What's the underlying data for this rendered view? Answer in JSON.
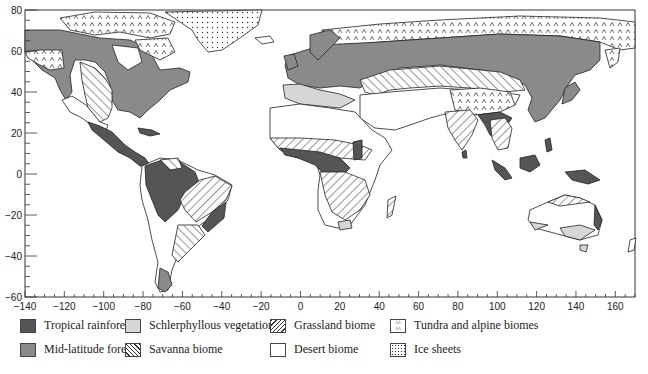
{
  "map": {
    "type": "world-biome-map",
    "projection": "equirectangular",
    "x_axis": {
      "range": [
        -140,
        170
      ],
      "ticks": [
        -140,
        -120,
        -100,
        -80,
        -60,
        -40,
        -20,
        0,
        20,
        40,
        60,
        80,
        100,
        120,
        140,
        160
      ],
      "tick_labels": [
        "−140",
        "−120",
        "−100",
        "−80",
        "−60",
        "−40",
        "−20",
        "0",
        "20",
        "40",
        "60",
        "80",
        "100",
        "120",
        "140",
        "160"
      ]
    },
    "y_axis": {
      "range": [
        -60,
        80
      ],
      "ticks": [
        80,
        60,
        40,
        20,
        0,
        -20,
        -40,
        -60
      ],
      "tick_labels": [
        "80",
        "60",
        "40",
        "20",
        "0",
        "−20",
        "−40",
        "−60"
      ]
    },
    "colors": {
      "tropical_rainforest": "#555555",
      "mid_latitude_forest": "#8a8a8a",
      "schlerphyllous": "#d6d6d6",
      "desert": "#ffffff",
      "outline": "#222222"
    }
  },
  "legend": {
    "items": [
      {
        "key": "tropical",
        "label": "Tropical rainforest",
        "icon": "solid-dark-swatch"
      },
      {
        "key": "midlat",
        "label": "Mid-latitude forest",
        "icon": "solid-medium-swatch"
      },
      {
        "key": "schler",
        "label": "Schlerphyllous vegetation",
        "icon": "solid-light-swatch"
      },
      {
        "key": "savanna",
        "label": "Savanna biome",
        "icon": "hatch-backslash-swatch"
      },
      {
        "key": "grass",
        "label": "Grassland biome",
        "icon": "hatch-slash-swatch"
      },
      {
        "key": "desert",
        "label": "Desert biome",
        "icon": "blank-swatch"
      },
      {
        "key": "tundra",
        "label": "Tundra and alpine biomes",
        "icon": "caret-pattern-swatch"
      },
      {
        "key": "ice",
        "label": "Ice sheets",
        "icon": "dot-pattern-swatch"
      }
    ]
  }
}
